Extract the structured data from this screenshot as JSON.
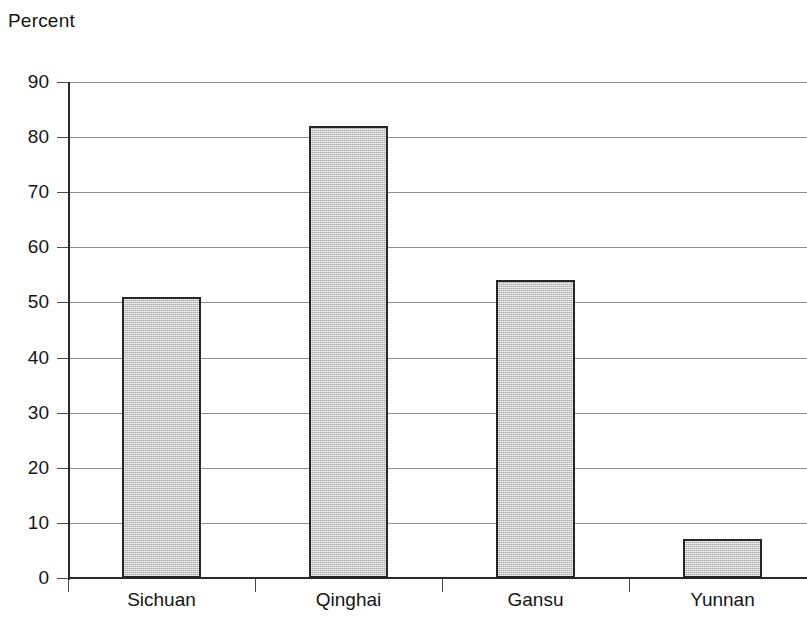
{
  "chart_data": {
    "type": "bar",
    "title": "Percent",
    "xlabel": "",
    "ylabel": "Percent",
    "categories": [
      "Sichuan",
      "Qinghai",
      "Gansu",
      "Yunnan"
    ],
    "values": [
      51,
      82,
      54,
      7
    ],
    "ylim": [
      0,
      90
    ],
    "ytick_labels": [
      "90",
      "80",
      "70",
      "60",
      "50",
      "40",
      "30",
      "20",
      "10",
      "0"
    ],
    "ytick_values": [
      90,
      80,
      70,
      60,
      50,
      40,
      30,
      20,
      10,
      0
    ],
    "ytick_step": 10,
    "grid": true,
    "legend": false,
    "legend_position": "none",
    "bar_fill_color": "#c9c9c9",
    "bar_border_color": "#262626",
    "gridline_color": "#8e8e8e",
    "axis_color": "#2a2a2a",
    "background_color": "#ffffff",
    "note": "gridlines extend past right edge; image cropped"
  }
}
